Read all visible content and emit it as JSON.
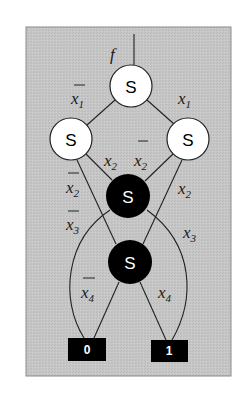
{
  "diagram": {
    "type": "switch-network / binary decision diagram",
    "colors": {
      "panel_bg": "#c4c4c4",
      "panel_border": "#8a8a8a",
      "white_node": "#ffffff",
      "black_node": "#000000",
      "edge": "#222222"
    },
    "output_label": "f",
    "nodes": [
      {
        "id": "top",
        "label": "S",
        "fill": "white"
      },
      {
        "id": "left",
        "label": "S",
        "fill": "white"
      },
      {
        "id": "right",
        "label": "S",
        "fill": "white"
      },
      {
        "id": "mid1",
        "label": "S",
        "fill": "black"
      },
      {
        "id": "mid2",
        "label": "S",
        "fill": "black"
      }
    ],
    "terminals": [
      {
        "id": "zero",
        "label": "0"
      },
      {
        "id": "one",
        "label": "1"
      }
    ],
    "edge_labels": {
      "top_left": {
        "var": "x",
        "sub": "1",
        "negated": true
      },
      "top_right": {
        "var": "x",
        "sub": "1",
        "negated": false
      },
      "left_mid1": {
        "var": "x",
        "sub": "2",
        "negated": false
      },
      "right_mid1": {
        "var": "x",
        "sub": "2",
        "negated": true
      },
      "left_mid2": {
        "var": "x",
        "sub": "2",
        "negated": true
      },
      "right_mid2": {
        "var": "x",
        "sub": "2",
        "negated": false
      },
      "mid1_zero": {
        "var": "x",
        "sub": "3",
        "negated": true
      },
      "mid1_one": {
        "var": "x",
        "sub": "3",
        "negated": false
      },
      "mid2_zero": {
        "var": "x",
        "sub": "4",
        "negated": true
      },
      "mid2_one": {
        "var": "x",
        "sub": "4",
        "negated": false
      }
    }
  }
}
